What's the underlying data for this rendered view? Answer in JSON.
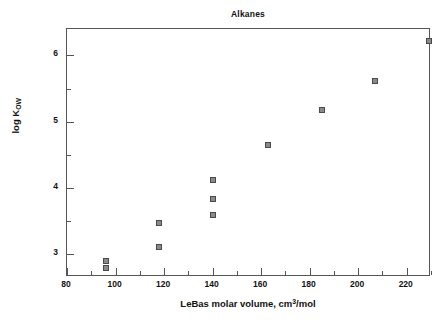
{
  "chart_data": {
    "type": "scatter",
    "title": "Alkanes",
    "xlabel_parts": {
      "pre": "LeBas molar volume, cm",
      "sup": "3",
      "post": "/mol"
    },
    "xlabel": "LeBas molar volume, cm3/mol",
    "ylabel_parts": {
      "pre": "log K",
      "sub": "OW"
    },
    "ylabel": "log KOW",
    "xlim": [
      80,
      230
    ],
    "ylim": [
      2.65,
      6.4
    ],
    "x_major_ticks": [
      80,
      100,
      120,
      140,
      160,
      180,
      200,
      220
    ],
    "x_minor_ticks": [
      90,
      110,
      130,
      150,
      170,
      190,
      210,
      230
    ],
    "x_tick_labels": [
      "80",
      "100",
      "120",
      "140",
      "160",
      "180",
      "200",
      "220"
    ],
    "y_major_ticks": [
      3,
      4,
      5,
      6
    ],
    "y_minor_ticks": [
      3.5,
      4.5,
      5.5
    ],
    "y_tick_labels": [
      "3",
      "4",
      "5",
      "6"
    ],
    "grid": false,
    "legend": false,
    "marker_color": "#8a8a8a",
    "marker_edge_color": "#4a4a4a",
    "frame_color": "#555555",
    "points": [
      {
        "x": 96,
        "y": 2.89
      },
      {
        "x": 96,
        "y": 2.79
      },
      {
        "x": 118,
        "y": 3.46
      },
      {
        "x": 118,
        "y": 3.11
      },
      {
        "x": 140,
        "y": 4.11
      },
      {
        "x": 140,
        "y": 3.83
      },
      {
        "x": 140,
        "y": 3.58
      },
      {
        "x": 163,
        "y": 4.65
      },
      {
        "x": 185,
        "y": 5.17
      },
      {
        "x": 207,
        "y": 5.62
      },
      {
        "x": 229,
        "y": 6.22
      }
    ]
  }
}
